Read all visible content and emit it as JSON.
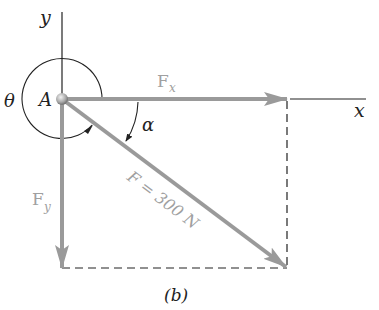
{
  "figure": {
    "caption": "(b)",
    "point_label": "A",
    "axes": {
      "x_label": "x",
      "y_label": "y"
    },
    "angles": {
      "theta": "θ",
      "alpha": "α"
    },
    "forces": {
      "fx": {
        "symbol": "F",
        "subscript": "x"
      },
      "fy": {
        "symbol": "F",
        "subscript": "y"
      },
      "f": {
        "label": "F = 300 N"
      }
    }
  },
  "colors": {
    "force_arrow": "#9a9a9a",
    "force_label": "#a0a0a0",
    "line": "#222222",
    "text": "#222222",
    "background": "#ffffff"
  }
}
